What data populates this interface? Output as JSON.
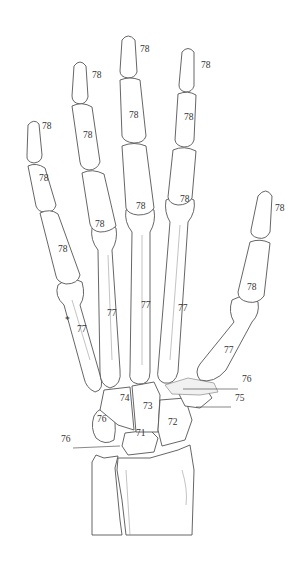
{
  "diagram": {
    "labels": [
      {
        "id": "little-distal",
        "text": "78",
        "x": 42,
        "y": 131
      },
      {
        "id": "little-middle",
        "text": "78",
        "x": 39,
        "y": 183
      },
      {
        "id": "little-proximal",
        "text": "78",
        "x": 58,
        "y": 254
      },
      {
        "id": "ring-distal",
        "text": "78",
        "x": 92,
        "y": 80
      },
      {
        "id": "ring-middle",
        "text": "78",
        "x": 83,
        "y": 140
      },
      {
        "id": "ring-proximal",
        "text": "78",
        "x": 95,
        "y": 229
      },
      {
        "id": "middle-distal",
        "text": "78",
        "x": 140,
        "y": 54
      },
      {
        "id": "middle-middle",
        "text": "78",
        "x": 129,
        "y": 120
      },
      {
        "id": "middle-proximal",
        "text": "78",
        "x": 136,
        "y": 211
      },
      {
        "id": "index-distal",
        "text": "78",
        "x": 201,
        "y": 70
      },
      {
        "id": "index-middle",
        "text": "78",
        "x": 184,
        "y": 122
      },
      {
        "id": "index-proximal",
        "text": "78",
        "x": 180,
        "y": 204
      },
      {
        "id": "thumb-distal",
        "text": "78",
        "x": 275,
        "y": 213
      },
      {
        "id": "thumb-proximal",
        "text": "78",
        "x": 247,
        "y": 292
      },
      {
        "id": "metacarpal-5",
        "text": "77",
        "x": 77,
        "y": 334
      },
      {
        "id": "metacarpal-4",
        "text": "77",
        "x": 107,
        "y": 318
      },
      {
        "id": "metacarpal-3",
        "text": "77",
        "x": 141,
        "y": 310
      },
      {
        "id": "metacarpal-2",
        "text": "77",
        "x": 178,
        "y": 313
      },
      {
        "id": "metacarpal-1",
        "text": "77",
        "x": 224,
        "y": 355
      },
      {
        "id": "hamate",
        "text": "74",
        "x": 120,
        "y": 403
      },
      {
        "id": "capitate",
        "text": "73",
        "x": 143,
        "y": 411
      },
      {
        "id": "trapezoid",
        "text": "72",
        "x": 168,
        "y": 427
      },
      {
        "id": "trapezium-pointer",
        "text": "76",
        "x": 242,
        "y": 384
      },
      {
        "id": "scaphoid-pointer",
        "text": "75",
        "x": 235,
        "y": 403
      },
      {
        "id": "triquetrum",
        "text": "76",
        "x": 97,
        "y": 424
      },
      {
        "id": "pisiform-pointer",
        "text": "76",
        "x": 61,
        "y": 444
      },
      {
        "id": "lunate",
        "text": "71",
        "x": 136,
        "y": 438
      }
    ],
    "annotations": [
      {
        "id": "asterisk",
        "text": "*",
        "x": 65,
        "y": 325
      }
    ]
  }
}
